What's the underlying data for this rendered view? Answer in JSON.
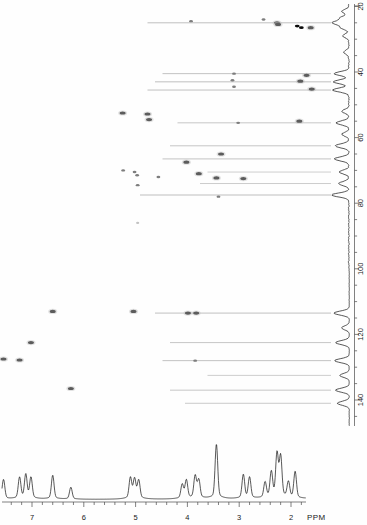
{
  "figure": {
    "ppm_label": "PPM"
  },
  "chart_data": {
    "type": "scatter",
    "xlabel": "PPM",
    "ylabel": "",
    "xlim": [
      7.62,
      1.33
    ],
    "ylim": [
      18,
      148
    ],
    "grid": false,
    "legend": null,
    "x_axis": {
      "nucleus": "1H",
      "unit": "ppm",
      "direction": "decreasing",
      "tick_labels": [
        "7",
        "6",
        "5",
        "4",
        "3",
        "2"
      ],
      "tick_values": [
        7,
        6,
        5,
        4,
        3,
        2
      ],
      "minor_tick_step": 0.2,
      "units_suffix": "PPM"
    },
    "y_axis": {
      "nucleus": "13C",
      "unit": "ppm",
      "direction": "increasing-downward",
      "tick_labels": [
        "20",
        "40",
        "60",
        "80",
        "100",
        "120",
        "140"
      ],
      "tick_values": [
        20,
        40,
        60,
        80,
        100,
        120,
        140
      ],
      "minor_tick_step": 5
    },
    "cross_peaks": [
      {
        "h": 2.53,
        "c": 24.0,
        "intensity": "faint"
      },
      {
        "h": 3.93,
        "c": 24.5,
        "intensity": "faint"
      },
      {
        "h": 2.27,
        "c": 25.0,
        "intensity": "strong"
      },
      {
        "h": 2.25,
        "c": 25.5,
        "intensity": "strong"
      },
      {
        "h": 1.88,
        "c": 26.0,
        "intensity": "medium"
      },
      {
        "h": 1.8,
        "c": 26.5,
        "intensity": "medium"
      },
      {
        "h": 1.62,
        "c": 26.5,
        "intensity": "strong"
      },
      {
        "h": 3.1,
        "c": 40.5,
        "intensity": "faint"
      },
      {
        "h": 1.7,
        "c": 41.0,
        "intensity": "strong"
      },
      {
        "h": 3.13,
        "c": 42.5,
        "intensity": "faint"
      },
      {
        "h": 1.82,
        "c": 42.8,
        "intensity": "strong"
      },
      {
        "h": 3.1,
        "c": 44.5,
        "intensity": "faint"
      },
      {
        "h": 1.6,
        "c": 45.2,
        "intensity": "strong"
      },
      {
        "h": 5.25,
        "c": 52.5,
        "intensity": "strong"
      },
      {
        "h": 4.77,
        "c": 52.8,
        "intensity": "strong"
      },
      {
        "h": 4.74,
        "c": 54.5,
        "intensity": "strong"
      },
      {
        "h": 1.84,
        "c": 55.0,
        "intensity": "strong"
      },
      {
        "h": 3.02,
        "c": 55.5,
        "intensity": "faint"
      },
      {
        "h": 3.35,
        "c": 65.0,
        "intensity": "strong"
      },
      {
        "h": 4.02,
        "c": 67.5,
        "intensity": "strong"
      },
      {
        "h": 5.24,
        "c": 70.0,
        "intensity": "faint"
      },
      {
        "h": 5.02,
        "c": 70.5,
        "intensity": "faint"
      },
      {
        "h": 3.78,
        "c": 71.0,
        "intensity": "strong"
      },
      {
        "h": 4.97,
        "c": 71.5,
        "intensity": "faint"
      },
      {
        "h": 4.56,
        "c": 72.0,
        "intensity": "faint"
      },
      {
        "h": 3.44,
        "c": 72.3,
        "intensity": "strong"
      },
      {
        "h": 2.92,
        "c": 72.5,
        "intensity": "strong"
      },
      {
        "h": 4.96,
        "c": 74.5,
        "intensity": "faint"
      },
      {
        "h": 3.4,
        "c": 78.0,
        "intensity": "faint"
      },
      {
        "h": 4.96,
        "c": 86.0,
        "intensity": "vfaint"
      },
      {
        "h": 5.04,
        "c": 113.0,
        "intensity": "strong"
      },
      {
        "h": 3.99,
        "c": 113.5,
        "intensity": "strong"
      },
      {
        "h": 3.83,
        "c": 113.5,
        "intensity": "strong"
      },
      {
        "h": 6.6,
        "c": 113.0,
        "intensity": "strong"
      },
      {
        "h": 7.02,
        "c": 122.5,
        "intensity": "strong"
      },
      {
        "h": 7.55,
        "c": 127.5,
        "intensity": "strong"
      },
      {
        "h": 7.24,
        "c": 127.8,
        "intensity": "strong"
      },
      {
        "h": 3.85,
        "c": 128.0,
        "intensity": "faint"
      },
      {
        "h": 6.25,
        "c": 136.5,
        "intensity": "strong"
      }
    ],
    "carbon_projection_peaks": [
      {
        "c": 21.5,
        "h_norm": 0.4
      },
      {
        "c": 23.5,
        "h_norm": 0.5
      },
      {
        "c": 25.0,
        "h_norm": 0.95
      },
      {
        "c": 26.5,
        "h_norm": 0.45
      },
      {
        "c": 29.0,
        "h_norm": 0.35
      },
      {
        "c": 34.0,
        "h_norm": 0.3
      },
      {
        "c": 40.5,
        "h_norm": 0.85
      },
      {
        "c": 43.0,
        "h_norm": 0.9
      },
      {
        "c": 45.5,
        "h_norm": 0.95
      },
      {
        "c": 52.0,
        "h_norm": 0.4
      },
      {
        "c": 55.5,
        "h_norm": 0.75
      },
      {
        "c": 59.0,
        "h_norm": 0.4
      },
      {
        "c": 62.5,
        "h_norm": 0.8
      },
      {
        "c": 66.5,
        "h_norm": 0.85
      },
      {
        "c": 70.5,
        "h_norm": 0.55
      },
      {
        "c": 74.0,
        "h_norm": 0.6
      },
      {
        "c": 77.5,
        "h_norm": 1.0
      },
      {
        "c": 113.5,
        "h_norm": 0.9
      },
      {
        "c": 118.0,
        "h_norm": 0.45
      },
      {
        "c": 122.5,
        "h_norm": 0.8
      },
      {
        "c": 128.0,
        "h_norm": 0.85
      },
      {
        "c": 132.5,
        "h_norm": 0.55
      },
      {
        "c": 137.0,
        "h_norm": 0.8
      },
      {
        "c": 141.0,
        "h_norm": 0.7
      }
    ],
    "proton_projection_peaks": [
      {
        "h": 7.55,
        "i": 0.28
      },
      {
        "h": 7.24,
        "i": 0.3
      },
      {
        "h": 7.12,
        "i": 0.34
      },
      {
        "h": 7.02,
        "i": 0.3
      },
      {
        "h": 6.6,
        "i": 0.34
      },
      {
        "h": 6.25,
        "i": 0.17
      },
      {
        "h": 5.1,
        "i": 0.3
      },
      {
        "h": 5.02,
        "i": 0.28
      },
      {
        "h": 4.94,
        "i": 0.26
      },
      {
        "h": 4.1,
        "i": 0.2
      },
      {
        "h": 4.02,
        "i": 0.26
      },
      {
        "h": 3.85,
        "i": 0.32
      },
      {
        "h": 3.78,
        "i": 0.26
      },
      {
        "h": 3.44,
        "i": 0.78
      },
      {
        "h": 2.92,
        "i": 0.34
      },
      {
        "h": 2.8,
        "i": 0.3
      },
      {
        "h": 2.5,
        "i": 0.22
      },
      {
        "h": 2.38,
        "i": 0.36
      },
      {
        "h": 2.27,
        "i": 0.62
      },
      {
        "h": 2.2,
        "i": 0.58
      },
      {
        "h": 2.05,
        "i": 0.22
      },
      {
        "h": 1.92,
        "i": 0.38
      },
      {
        "h": 1.62,
        "i": 0.14
      }
    ]
  }
}
